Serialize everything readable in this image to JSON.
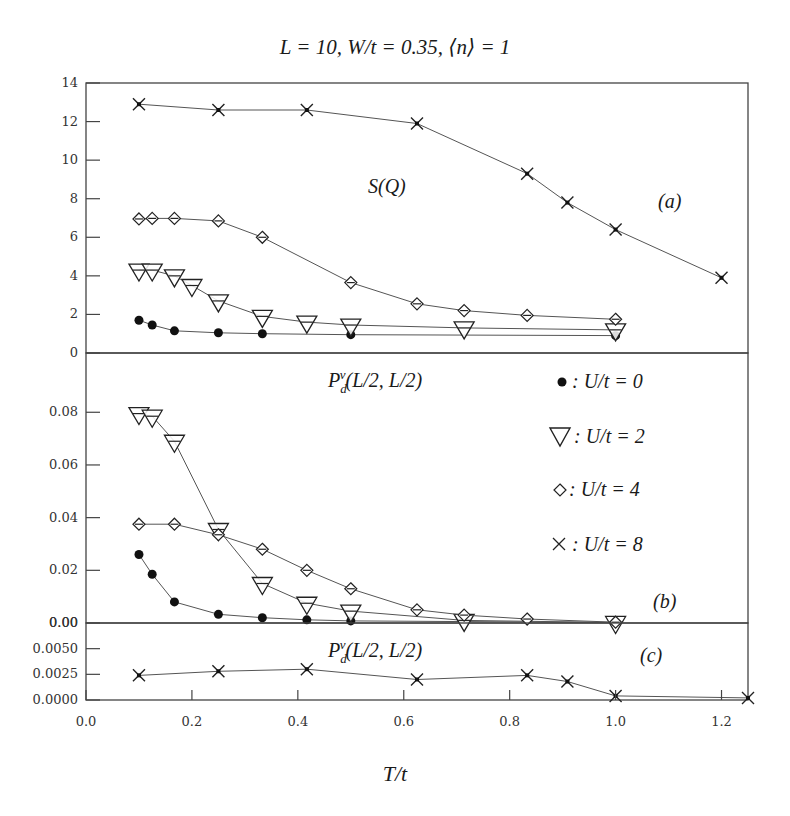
{
  "chart_data": {
    "type": "line",
    "title": "L = 10, W/t = 0.35, ⟨n⟩ = 1",
    "xlabel": "T/t",
    "xlim": [
      0.0,
      1.25
    ],
    "xticks": [
      "0.0",
      "0.2",
      "0.4",
      "0.6",
      "0.8",
      "1.0",
      "1.2"
    ],
    "legend": [
      {
        "marker": "filled-circle",
        "label": ": U/t = 0"
      },
      {
        "marker": "open-triangle-down",
        "label": ": U/t = 2"
      },
      {
        "marker": "open-diamond",
        "label": ": U/t = 4"
      },
      {
        "marker": "cross",
        "label": ": U/t = 8"
      }
    ],
    "legend_position": "panel (b), upper right",
    "panels": [
      {
        "id": "a",
        "panel_label": "(a)",
        "quantity_label": "S(Q⃗)",
        "ylabel": "",
        "ylim": [
          0,
          14
        ],
        "yticks": [
          "0",
          "2",
          "4",
          "6",
          "8",
          "10",
          "12",
          "14"
        ],
        "series": [
          {
            "name": "U/t = 0",
            "marker": "filled-circle",
            "x": [
              0.1,
              0.125,
              0.167,
              0.25,
              0.333,
              0.5,
              1.0
            ],
            "y": [
              1.7,
              1.45,
              1.15,
              1.05,
              1.0,
              0.95,
              0.9
            ]
          },
          {
            "name": "U/t = 2",
            "marker": "open-triangle-down",
            "x": [
              0.1,
              0.125,
              0.167,
              0.2,
              0.25,
              0.333,
              0.417,
              0.5,
              0.714,
              1.0
            ],
            "y": [
              4.3,
              4.3,
              4.0,
              3.5,
              2.7,
              1.9,
              1.6,
              1.45,
              1.3,
              1.2
            ]
          },
          {
            "name": "U/t = 4",
            "marker": "open-diamond",
            "x": [
              0.1,
              0.125,
              0.167,
              0.25,
              0.333,
              0.5,
              0.625,
              0.714,
              0.833,
              1.0
            ],
            "y": [
              6.95,
              6.98,
              6.98,
              6.85,
              6.0,
              3.65,
              2.55,
              2.2,
              1.95,
              1.75
            ]
          },
          {
            "name": "U/t = 8",
            "marker": "cross",
            "x": [
              0.1,
              0.25,
              0.417,
              0.625,
              0.833,
              0.909,
              1.0,
              1.2
            ],
            "y": [
              12.9,
              12.6,
              12.6,
              11.9,
              9.3,
              7.8,
              6.4,
              3.9
            ]
          }
        ]
      },
      {
        "id": "b",
        "panel_label": "(b)",
        "quantity_label": "P_d^v(L/2, L/2)",
        "ylabel": "",
        "ylim": [
          0,
          0.1025
        ],
        "yticks": [
          "0.00",
          "0.02",
          "0.04",
          "0.06",
          "0.08"
        ],
        "series": [
          {
            "name": "U/t = 0",
            "marker": "filled-circle",
            "x": [
              0.1,
              0.125,
              0.167,
              0.25,
              0.333,
              0.417,
              0.5,
              1.0
            ],
            "y": [
              0.026,
              0.0185,
              0.008,
              0.0033,
              0.002,
              0.0012,
              0.0008,
              0.0002
            ]
          },
          {
            "name": "U/t = 2",
            "marker": "open-triangle-down",
            "x": [
              0.1,
              0.125,
              0.167,
              0.25,
              0.333,
              0.417,
              0.5,
              0.714,
              1.0
            ],
            "y": [
              0.0795,
              0.0785,
              0.069,
              0.0355,
              0.015,
              0.0075,
              0.0045,
              0.001,
              0.0002
            ]
          },
          {
            "name": "U/t = 4",
            "marker": "open-diamond",
            "x": [
              0.1,
              0.167,
              0.25,
              0.333,
              0.417,
              0.5,
              0.625,
              0.714,
              0.833,
              1.0
            ],
            "y": [
              0.0375,
              0.0375,
              0.0335,
              0.028,
              0.02,
              0.013,
              0.005,
              0.003,
              0.0015,
              0.0003
            ]
          }
        ]
      },
      {
        "id": "c",
        "panel_label": "(c)",
        "quantity_label": "P_d^v(L/2, L/2)",
        "ylabel": "",
        "ylim": [
          0,
          0.0075
        ],
        "yticks": [
          "0.0000",
          "0.0025",
          "0.0050",
          "0.00"
        ],
        "series": [
          {
            "name": "U/t = 8",
            "marker": "cross",
            "x": [
              0.1,
              0.25,
              0.417,
              0.625,
              0.833,
              0.909,
              1.0,
              1.25
            ],
            "y": [
              0.0024,
              0.0028,
              0.003,
              0.002,
              0.0024,
              0.0018,
              0.0004,
              0.0002
            ]
          }
        ]
      }
    ]
  },
  "figure": {
    "title": "L = 10, W/t = 0.35, ⟨n⟩ = 1",
    "xlabel": "T/t",
    "panel_a": {
      "label": "(a)",
      "quantity": "S(Q)"
    },
    "panel_b": {
      "label": "(b)",
      "quantity": "P",
      "quantity_sub": "d",
      "quantity_sup": "v",
      "quantity_args": "(L/2, L/2)"
    },
    "panel_c": {
      "label": "(c)",
      "quantity": "P",
      "quantity_sub": "d",
      "quantity_sup": "v",
      "quantity_args": "(L/2, L/2)"
    },
    "legend": {
      "u0": ": U/t = 0",
      "u2": ": U/t = 2",
      "u4": ": U/t = 4",
      "u8": ": U/t = 8"
    }
  }
}
